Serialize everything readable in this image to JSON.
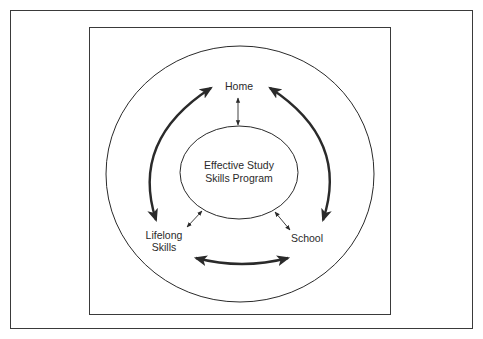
{
  "diagram": {
    "center_node": {
      "line1": "Effective Study",
      "line2": "Skills Program"
    },
    "nodes": {
      "home": "Home",
      "lifelong_line1": "Lifelong",
      "lifelong_line2": "Skills",
      "school": "School"
    },
    "caption": ""
  },
  "colors": {
    "stroke": "#2a2a2a",
    "frame": "#3a3a3a",
    "background": "#ffffff"
  }
}
